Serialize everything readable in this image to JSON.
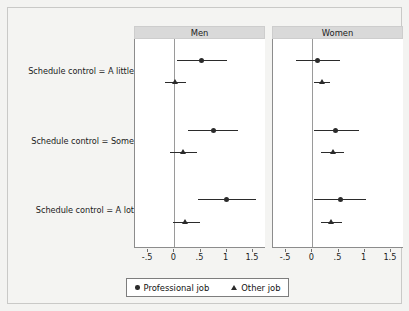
{
  "figure": {
    "background_color": "#f3f3f1",
    "panel_header_color": "#d9d9d9",
    "marker_color": "#2b2b2b"
  },
  "legend": {
    "professional_label": "Professional job",
    "other_label": "Other job",
    "professional_marker": "circle-marker",
    "other_marker": "triangle-marker"
  },
  "chart_data": {
    "type": "scatter",
    "title": "",
    "xlabel": "",
    "ylabel": "",
    "xlim": [
      -0.75,
      1.75
    ],
    "xticks": [
      -0.5,
      0,
      0.5,
      1,
      1.5
    ],
    "xticklabels": [
      "-.5",
      "0",
      ".5",
      "1",
      "1.5"
    ],
    "reference_line_x": 0,
    "grid": false,
    "legend_position": "bottom",
    "categories": [
      "Schedule control = A little",
      "Schedule control = Some",
      "Schedule control = A lot"
    ],
    "panels": [
      {
        "name": "Men",
        "series": [
          {
            "name": "Professional job",
            "marker": "circle",
            "values": [
              0.52,
              0.75,
              1.0
            ],
            "ci_low": [
              0.05,
              0.27,
              0.45
            ],
            "ci_high": [
              1.0,
              1.22,
              1.55
            ]
          },
          {
            "name": "Other job",
            "marker": "triangle",
            "values": [
              0.02,
              0.16,
              0.2
            ],
            "ci_low": [
              -0.17,
              -0.09,
              -0.02
            ],
            "ci_high": [
              0.22,
              0.43,
              0.5
            ]
          }
        ]
      },
      {
        "name": "Women",
        "series": [
          {
            "name": "Professional job",
            "marker": "circle",
            "values": [
              0.1,
              0.45,
              0.53
            ],
            "ci_low": [
              -0.32,
              0.03,
              0.03
            ],
            "ci_high": [
              0.52,
              0.9,
              1.02
            ]
          },
          {
            "name": "Other job",
            "marker": "triangle",
            "values": [
              0.18,
              0.39,
              0.36
            ],
            "ci_low": [
              0.03,
              0.17,
              0.17
            ],
            "ci_high": [
              0.33,
              0.6,
              0.57
            ]
          }
        ]
      }
    ]
  }
}
